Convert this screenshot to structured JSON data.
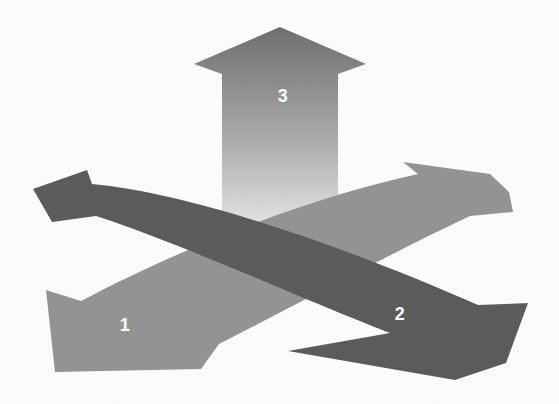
{
  "canvas": {
    "width": 559,
    "height": 404,
    "background_color": "#fdfdfd"
  },
  "arrows": [
    {
      "id": "arrow-1",
      "label": "1",
      "color": "#929292",
      "label_color": "#ffffff",
      "heads": 2,
      "direction": "lower-left to upper-right"
    },
    {
      "id": "arrow-2",
      "label": "2",
      "color": "#585858",
      "label_color": "#ffffff",
      "heads": 2,
      "direction": "upper-left to lower-right"
    },
    {
      "id": "arrow-3",
      "label": "3",
      "label_color": "#ffffff",
      "heads": 1,
      "direction": "up",
      "gradient_top": "#6c6c6c",
      "gradient_mid": "#a8a8a8",
      "gradient_bottom": "#f2f2f2"
    }
  ]
}
